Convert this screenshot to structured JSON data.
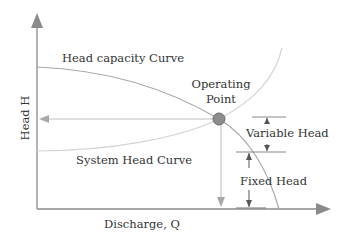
{
  "diagram": {
    "axes": {
      "x_label": "Discharge, Q",
      "y_label": "Head H"
    },
    "curves": [
      {
        "name": "head-capacity-curve",
        "label": "Head capacity Curve"
      },
      {
        "name": "system-head-curve",
        "label": "System Head Curve"
      }
    ],
    "operating_point": {
      "label_line1": "Operating",
      "label_line2": "Point"
    },
    "annotations": {
      "variable_head": "Variable Head",
      "fixed_head": "Fixed Head"
    },
    "colors": {
      "axis": "#8a8a8a",
      "head_curve": "#a8a8a8",
      "system_curve": "#d4d4d4",
      "operating_point_fill": "#8c8c8c",
      "operating_point_stroke": "#6e6e6e",
      "annotation": "#555555",
      "text": "#333333"
    }
  }
}
